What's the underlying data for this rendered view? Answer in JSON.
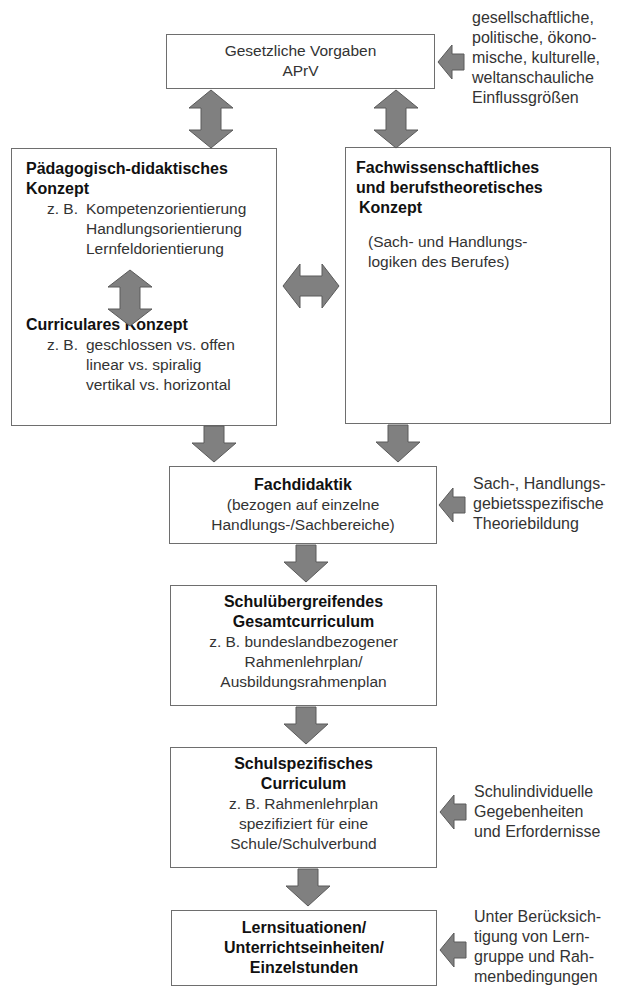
{
  "diagram": {
    "arrow_color": "#808080",
    "arrow_stroke": "#5a5a5a",
    "border_color": "#6e6e6e",
    "nodes": {
      "legal": {
        "lines": [
          "Gesetzliche Vorgaben",
          "APrV"
        ]
      },
      "pedagogical": {
        "title_lines": [
          "Pädagogisch-didaktisches",
          "Konzept"
        ],
        "example_label": "z. B.",
        "examples": [
          "Kompetenzorientierung",
          "Handlungsorientierung",
          "Lernfeldorientierung"
        ]
      },
      "curricular": {
        "title": "Curriculares Konzept",
        "example_label": "z. B.",
        "examples": [
          "geschlossen vs. offen",
          "linear vs. spiralig",
          "vertikal vs. horizontal"
        ]
      },
      "subject": {
        "title_lines": [
          "Fachwissenschaftliches",
          "und berufstheoretisches",
          "Konzept"
        ],
        "desc_lines": [
          "(Sach- und Handlungs-",
          "logiken des Berufes)"
        ]
      },
      "didactics": {
        "title": "Fachdidaktik",
        "desc_lines": [
          "(bezogen auf einzelne",
          "Handlungs-/Sachbereiche)"
        ]
      },
      "overall_curriculum": {
        "title_lines": [
          "Schulübergreifendes",
          "Gesamtcurriculum"
        ],
        "desc_lines": [
          "z. B. bundeslandbezogener",
          "Rahmenlehrplan/",
          "Ausbildungsrahmenplan"
        ]
      },
      "school_curriculum": {
        "title_lines": [
          "Schulspezifisches",
          "Curriculum"
        ],
        "desc_lines": [
          "z. B. Rahmenlehrplan",
          "spezifiziert für eine",
          "Schule/Schulverbund"
        ]
      },
      "lessons": {
        "title_lines": [
          "Lernsituationen/",
          "Unterrichtseinheiten/",
          "Einzelstunden"
        ]
      }
    },
    "influences": {
      "legal": [
        "gesellschaftliche,",
        "politische, ökono-",
        "mische, kulturelle,",
        "weltanschauliche",
        "Einflussgrößen"
      ],
      "didactics": [
        "Sach-, Handlungs-",
        "gebietsspezifische",
        "Theoriebildung"
      ],
      "school_curriculum": [
        "Schulindividuelle",
        "Gegebenheiten",
        "und Erfordernisse"
      ],
      "lessons": [
        "Unter Berücksich-",
        "tigung von Lern-",
        "gruppe und Rah-",
        "menbedingungen"
      ]
    },
    "edges": [
      {
        "from": "legal",
        "to": "pedagogical",
        "type": "bidirectional-vertical"
      },
      {
        "from": "legal",
        "to": "subject",
        "type": "bidirectional-vertical"
      },
      {
        "from": "pedagogical",
        "to": "curricular",
        "type": "bidirectional-vertical"
      },
      {
        "from": "pedagogical",
        "to": "subject",
        "type": "bidirectional-horizontal"
      },
      {
        "from": "curricular",
        "to": "didactics",
        "type": "down"
      },
      {
        "from": "subject",
        "to": "didactics",
        "type": "down"
      },
      {
        "from": "didactics",
        "to": "overall_curriculum",
        "type": "down"
      },
      {
        "from": "overall_curriculum",
        "to": "school_curriculum",
        "type": "down"
      },
      {
        "from": "school_curriculum",
        "to": "lessons",
        "type": "down"
      },
      {
        "from": "influence-legal",
        "to": "legal",
        "type": "left"
      },
      {
        "from": "influence-didactics",
        "to": "didactics",
        "type": "left"
      },
      {
        "from": "influence-school",
        "to": "school_curriculum",
        "type": "left"
      },
      {
        "from": "influence-lessons",
        "to": "lessons",
        "type": "left"
      }
    ]
  }
}
